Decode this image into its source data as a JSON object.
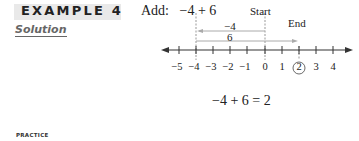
{
  "header": {
    "example_label": "EXAMPLE 4",
    "instruction": "Add:",
    "expression": "−4 + 6"
  },
  "solution_label": "Solution",
  "number_line": {
    "start_label": "Start",
    "end_label": "End",
    "arrow_neg4_label": "−4",
    "arrow_6_label": "6",
    "ticks": [
      "−5",
      "−4",
      "−3",
      "−2",
      "−1",
      "0",
      "1",
      "2",
      "3",
      "4"
    ],
    "circled_value": "2"
  },
  "result": "−4 + 6 = 2",
  "practice_label": "PRACTICE"
}
